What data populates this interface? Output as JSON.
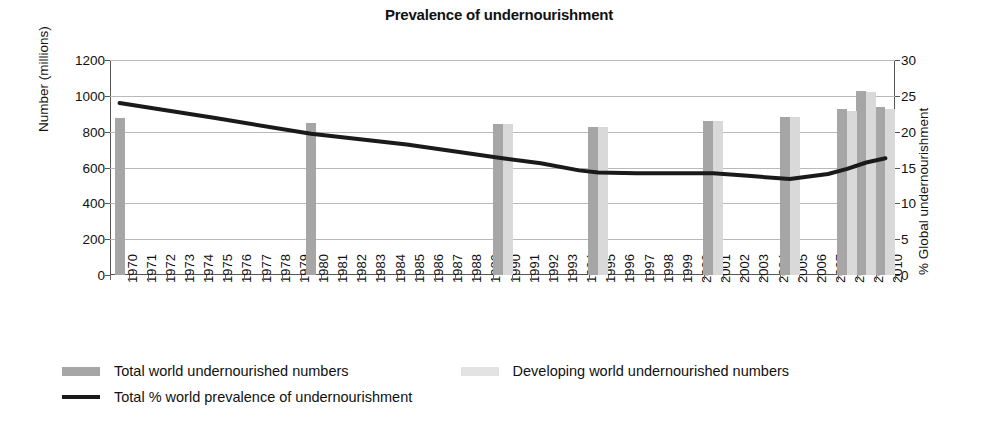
{
  "chart_data": {
    "type": "bar",
    "title": "Prevalence of undernourishment",
    "xlabel": "",
    "ylabel": "Number (millions)",
    "y2label": "% Global undernourishment",
    "ylim": [
      0,
      1200
    ],
    "y2lim": [
      0,
      30
    ],
    "yticks": [
      "0",
      "200",
      "400",
      "600",
      "800",
      "1000",
      "1200"
    ],
    "y2ticks": [
      "0",
      "5",
      "10",
      "15",
      "20",
      "25",
      "30"
    ],
    "ytick_values": [
      0,
      200,
      400,
      600,
      800,
      1000,
      1200
    ],
    "y2tick_values": [
      0,
      5,
      10,
      15,
      20,
      25,
      30
    ],
    "grid": true,
    "legend_position": "bottom-left",
    "categories": [
      "1970",
      "1971",
      "1972",
      "1973",
      "1974",
      "1975",
      "1976",
      "1977",
      "1978",
      "1979",
      "1980",
      "1981",
      "1982",
      "1983",
      "1984",
      "1985",
      "1986",
      "1987",
      "1988",
      "1989",
      "1990",
      "1991",
      "1992",
      "1993",
      "1994",
      "1995",
      "1996",
      "1997",
      "1998",
      "1999",
      "2000",
      "2001",
      "2002",
      "2003",
      "2004",
      "2005",
      "2006",
      "2007",
      "2008",
      "2009",
      "2010"
    ],
    "series": [
      {
        "name": "Total world undernourished numbers",
        "type": "bar",
        "color": "#a6a6a6",
        "axis": "left",
        "points": [
          {
            "x": "1970",
            "y": 875
          },
          {
            "x": "1980",
            "y": 850
          },
          {
            "x": "1990",
            "y": 843
          },
          {
            "x": "1995",
            "y": 825
          },
          {
            "x": "2001",
            "y": 858
          },
          {
            "x": "2005",
            "y": 880
          },
          {
            "x": "2008",
            "y": 928
          },
          {
            "x": "2009",
            "y": 1028
          },
          {
            "x": "2010",
            "y": 938
          }
        ]
      },
      {
        "name": "Developing world undernourished numbers",
        "type": "bar",
        "color": "#d9d9d9",
        "axis": "left",
        "points": [
          {
            "x": "1990",
            "y": 843
          },
          {
            "x": "1995",
            "y": 828
          },
          {
            "x": "2001",
            "y": 860
          },
          {
            "x": "2005",
            "y": 882
          },
          {
            "x": "2008",
            "y": 915
          },
          {
            "x": "2009",
            "y": 1020
          },
          {
            "x": "2010",
            "y": 925
          }
        ]
      },
      {
        "name": "Total % world prevalence of undernourishment",
        "type": "line",
        "color": "#1a1a1a",
        "axis": "right",
        "points": [
          {
            "x": "1970",
            "y": 24.0
          },
          {
            "x": "1975",
            "y": 21.9
          },
          {
            "x": "1980",
            "y": 19.7
          },
          {
            "x": "1985",
            "y": 18.2
          },
          {
            "x": "1990",
            "y": 16.3
          },
          {
            "x": "1992",
            "y": 15.6
          },
          {
            "x": "1994",
            "y": 14.6
          },
          {
            "x": "1995",
            "y": 14.3
          },
          {
            "x": "1997",
            "y": 14.2
          },
          {
            "x": "2000",
            "y": 14.2
          },
          {
            "x": "2001",
            "y": 14.2
          },
          {
            "x": "2003",
            "y": 13.8
          },
          {
            "x": "2005",
            "y": 13.4
          },
          {
            "x": "2007",
            "y": 14.1
          },
          {
            "x": "2008",
            "y": 14.8
          },
          {
            "x": "2009",
            "y": 15.7
          },
          {
            "x": "2010",
            "y": 16.3
          }
        ]
      }
    ]
  },
  "legend": {
    "items": [
      {
        "label": "Total world undernourished numbers",
        "marker": "swatch-total"
      },
      {
        "label": "Developing world undernourished numbers",
        "marker": "swatch-developing"
      },
      {
        "label": "Total % world prevalence of undernourishment",
        "marker": "swatch-line"
      }
    ]
  },
  "colors": {
    "total_bar": "#a6a6a6",
    "developing_bar": "#d9d9d9",
    "line": "#1a1a1a",
    "grid": "#b9b9b9",
    "axis": "#555555",
    "text": "#111111",
    "background": "#ffffff"
  }
}
